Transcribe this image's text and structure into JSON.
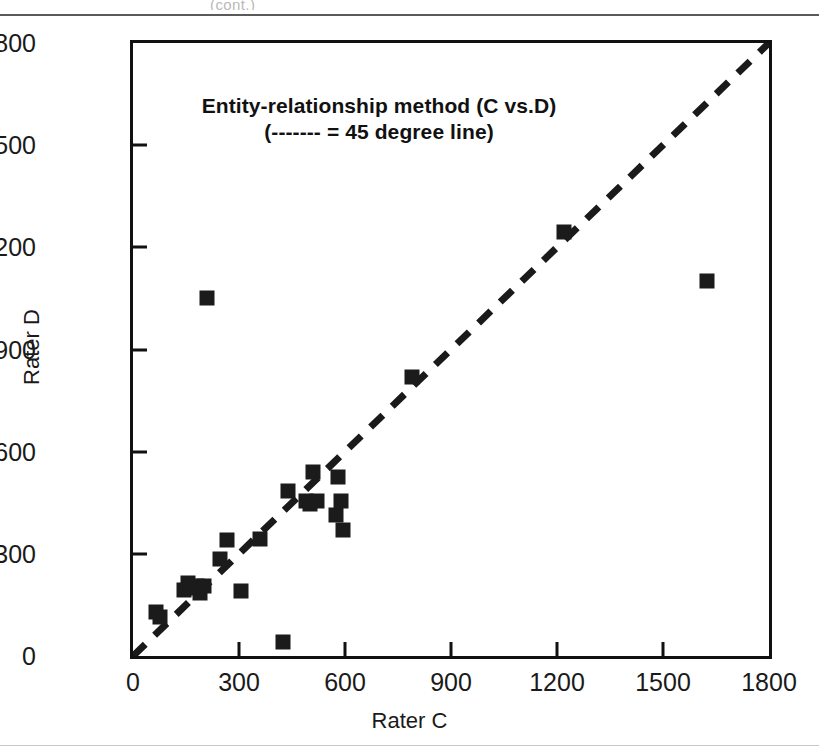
{
  "page": {
    "clipped_header_text": "(cont.)"
  },
  "figure": {
    "y_axis_title": "Rater D",
    "x_axis_title": "Rater C",
    "title_line1": "Entity-relationship method (C vs.D)",
    "title_line2": "(------- = 45 degree line)",
    "marker_color": "#1b1b1b",
    "axis_color": "#111111",
    "reference_line_color": "#1a1a1a"
  },
  "chart_data": {
    "type": "scatter",
    "title": "Entity-relationship method (C vs.D)",
    "subtitle": "(------- = 45 degree line)",
    "xlabel": "Rater C",
    "ylabel": "Rater D",
    "xlim": [
      0,
      1800
    ],
    "ylim": [
      0,
      1800
    ],
    "xticks": [
      0,
      300,
      600,
      900,
      1200,
      1500,
      1800
    ],
    "yticks": [
      0,
      300,
      600,
      900,
      1200,
      1500,
      1800
    ],
    "grid": false,
    "legend": "none",
    "annotations": [
      {
        "text": "45 degree line",
        "type": "reference-line",
        "style": "dashed",
        "from": [
          0,
          0
        ],
        "to": [
          1800,
          1800
        ]
      }
    ],
    "series": [
      {
        "name": "Rater C vs Rater D",
        "marker": "square",
        "points": [
          [
            65,
            130
          ],
          [
            75,
            115
          ],
          [
            145,
            195
          ],
          [
            155,
            215
          ],
          [
            165,
            200
          ],
          [
            180,
            205
          ],
          [
            190,
            185
          ],
          [
            200,
            205
          ],
          [
            210,
            1050
          ],
          [
            245,
            285
          ],
          [
            265,
            340
          ],
          [
            305,
            190
          ],
          [
            360,
            345
          ],
          [
            425,
            40
          ],
          [
            440,
            485
          ],
          [
            490,
            455
          ],
          [
            500,
            445
          ],
          [
            510,
            540
          ],
          [
            520,
            455
          ],
          [
            575,
            415
          ],
          [
            580,
            525
          ],
          [
            590,
            455
          ],
          [
            595,
            370
          ],
          [
            790,
            820
          ],
          [
            1220,
            1245
          ],
          [
            1625,
            1100
          ]
        ]
      }
    ]
  }
}
